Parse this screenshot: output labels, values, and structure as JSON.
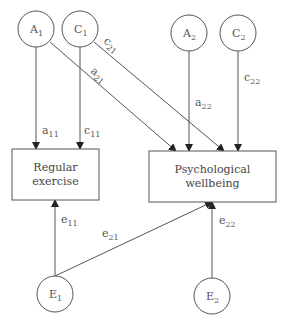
{
  "nodes": {
    "A1": {
      "base": "A",
      "sub": "1"
    },
    "C1": {
      "base": "C",
      "sub": "1"
    },
    "A2": {
      "base": "A",
      "sub": "2"
    },
    "C2": {
      "base": "C",
      "sub": "2"
    },
    "E1": {
      "base": "E",
      "sub": "1"
    },
    "E2": {
      "base": "E",
      "sub": "2"
    },
    "regular_exercise": {
      "line1": "Regular",
      "line2": "exercise"
    },
    "psychological_wellbeing": {
      "line1": "Psychological",
      "line2": "wellbeing"
    }
  },
  "paths": {
    "a11": {
      "base": "a",
      "sub": "11"
    },
    "c11": {
      "base": "c",
      "sub": "11"
    },
    "a21": {
      "base": "a",
      "sub": "21"
    },
    "c21": {
      "base": "c",
      "sub": "21"
    },
    "a22": {
      "base": "a",
      "sub": "22"
    },
    "c22": {
      "base": "c",
      "sub": "22"
    },
    "e11": {
      "base": "e",
      "sub": "11"
    },
    "e21": {
      "base": "e",
      "sub": "21"
    },
    "e22": {
      "base": "e",
      "sub": "22"
    }
  },
  "colors": {
    "stroke": "#555555",
    "background": "#ffffff"
  }
}
